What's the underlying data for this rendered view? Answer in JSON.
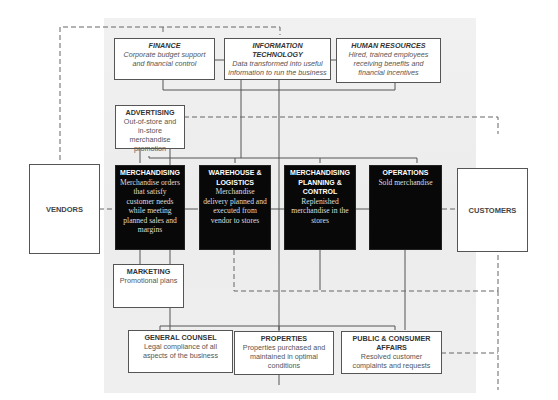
{
  "diagram": {
    "support_top": [
      {
        "title": "FINANCE",
        "text": "Corporate budget support and financial control"
      },
      {
        "title": "INFORMATION TECHNOLOGY",
        "text": "Data transformed into useful information to run the business"
      },
      {
        "title": "HUMAN RESOURCES",
        "text": "Hired, trained employees receiving benefits and financial incentives"
      }
    ],
    "advertising": {
      "title": "ADVERTISING",
      "text": "Out-of-store and in-store merchandise promotion"
    },
    "core": [
      {
        "title": "MERCHANDISING",
        "text": "Merchandise orders that satisfy customer needs while meeting planned sales and margins"
      },
      {
        "title": "WAREHOUSE & LOGISTICS",
        "text": "Merchandise delivery planned and executed from vendor to stores"
      },
      {
        "title": "MERCHANDISING PLANNING & CONTROL",
        "text": "Replenished merchandise in the stores"
      },
      {
        "title": "OPERATIONS",
        "text": "Sold merchandise"
      }
    ],
    "vendors": "VENDORS",
    "customers": "CUSTOMERS",
    "marketing": {
      "title": "MARKETING",
      "text": "Promotional plans"
    },
    "support_bottom": [
      {
        "title": "GENERAL COUNSEL",
        "text": "Legal compliance of all aspects of the business"
      },
      {
        "title": "PROPERTIES",
        "text": "Properties purchased and maintained in optimal conditions"
      },
      {
        "title": "PUBLIC & CONSUMER AFFAIRS",
        "text": "Resolved customer complaints and requests"
      }
    ]
  }
}
